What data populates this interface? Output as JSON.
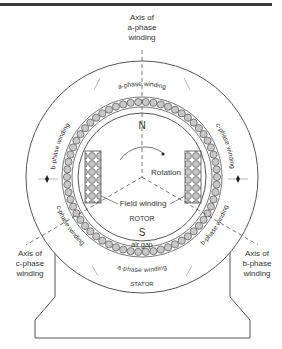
{
  "diagram": {
    "axes": {
      "a": [
        "Axis of",
        "a-phase",
        "winding"
      ],
      "b": [
        "Axis of",
        "b-phase",
        "winding"
      ],
      "c": [
        "Axis of",
        "c-phase",
        "winding"
      ]
    },
    "windings": {
      "a_top": "a-phase winding",
      "a_bottom": "a-phase winding",
      "b_upper_left": "b-phase winding",
      "b_lower_right": "b-phase winding",
      "c_upper_right": "c-phase winding",
      "c_lower_left": "c-phase winding"
    },
    "rotor": {
      "north": "N",
      "south": "S",
      "rotation": "Rotation",
      "field_winding": "Field winding",
      "label": "ROTOR"
    },
    "air_gap": "air gap",
    "stator": "STATOR",
    "colors": {
      "line": "#555555",
      "coil_fill": "#c8c8c8",
      "text": "#333333",
      "bar": "#3a3a3a"
    }
  }
}
